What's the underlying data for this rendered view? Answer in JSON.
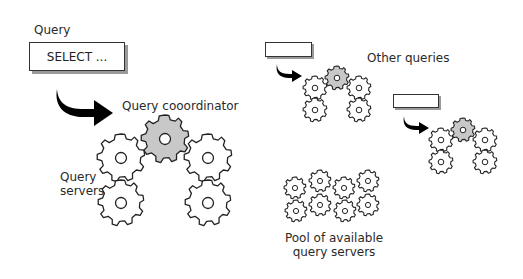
{
  "diagram": {
    "main_group": {
      "query_label": "Query",
      "query_box_text": "SELECT ...",
      "coordinator_label": "Query cooordinator",
      "servers_label_line1": "Query",
      "servers_label_line2": "servers"
    },
    "other_queries": {
      "label": "Other queries",
      "groups": 2
    },
    "pool": {
      "label_line1": "Pool of available",
      "label_line2": "query servers",
      "gear_count": 8
    },
    "colors": {
      "coordinator_fill": "#c8c8c8",
      "server_fill": "#ffffff",
      "stroke": "#222222",
      "arrow": "#000000",
      "box_shadow": "#9a9a9a"
    },
    "icons": {
      "gear": "gear-icon",
      "arrow": "curved-arrow-icon"
    }
  }
}
